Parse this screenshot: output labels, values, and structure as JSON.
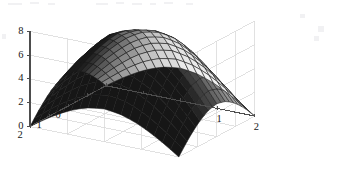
{
  "figure": {
    "kind": "surface-plot-3d",
    "background_color": "#ffffff",
    "axis_line_color": "#4d4d4d",
    "grid_color": "#d9d9d9",
    "mesh_line_color": "#1a1a1a",
    "tick_label_color": "#171717",
    "title": "",
    "artifact_note": "faint scan speckles along top edge"
  },
  "axes": {
    "z": {
      "label": "",
      "ticks": [
        "8",
        "6",
        "4",
        "2",
        "0"
      ],
      "values": [
        8,
        6,
        4,
        2,
        0
      ],
      "range": [
        0,
        8
      ]
    },
    "y": {
      "label": "",
      "ticks": [
        "2",
        "1",
        "0",
        "-1",
        "-2"
      ],
      "values": [
        2,
        1,
        0,
        -1,
        -2
      ],
      "range": [
        -2,
        2
      ]
    },
    "x": {
      "label": "",
      "ticks": [
        "-2",
        "-1",
        "0",
        "1",
        "2"
      ],
      "values": [
        -2,
        -1,
        0,
        1,
        2
      ],
      "range": [
        -2,
        2
      ]
    }
  },
  "chart_data": {
    "type": "surface",
    "title": "",
    "xlabel": "",
    "ylabel": "",
    "zlabel": "",
    "colormap": "gray",
    "shading": "faceted",
    "grid": true,
    "legend": null,
    "xlim": [
      -2,
      2
    ],
    "ylim": [
      -2,
      2
    ],
    "zlim": [
      0,
      8
    ],
    "xticks": [
      -2,
      -1,
      0,
      1,
      2
    ],
    "yticks": [
      -2,
      -1,
      0,
      1,
      2
    ],
    "zticks": [
      0,
      2,
      4,
      6,
      8
    ],
    "surface_form": "dome / inverted paraboloid peaking near center",
    "peak_value": 7.2,
    "peak_at": [
      0,
      0
    ],
    "corner_value": 0.0,
    "x": [
      -2,
      -1.6,
      -1.2,
      -0.8,
      -0.4,
      0,
      0.4,
      0.8,
      1.2,
      1.6,
      2
    ],
    "y": [
      -2,
      -1.6,
      -1.2,
      -0.8,
      -0.4,
      0,
      0.4,
      0.8,
      1.2,
      1.6,
      2
    ],
    "z": [
      [
        0.0,
        0.85,
        1.6,
        2.2,
        2.6,
        2.75,
        2.6,
        2.2,
        1.6,
        0.85,
        0.0
      ],
      [
        0.85,
        1.95,
        2.95,
        3.75,
        4.25,
        4.45,
        4.25,
        3.75,
        2.95,
        1.95,
        0.85
      ],
      [
        1.6,
        2.95,
        4.1,
        5.05,
        5.65,
        5.85,
        5.65,
        5.05,
        4.1,
        2.95,
        1.6
      ],
      [
        2.2,
        3.75,
        5.05,
        6.1,
        6.75,
        6.95,
        6.75,
        6.1,
        5.05,
        3.75,
        2.2
      ],
      [
        2.6,
        4.25,
        5.65,
        6.75,
        7.1,
        7.2,
        7.1,
        6.75,
        5.65,
        4.25,
        2.6
      ],
      [
        2.75,
        4.45,
        5.85,
        6.95,
        7.2,
        7.2,
        7.2,
        6.95,
        5.85,
        4.45,
        2.75
      ],
      [
        2.6,
        4.25,
        5.65,
        6.75,
        7.1,
        7.2,
        7.1,
        6.75,
        5.65,
        4.25,
        2.6
      ],
      [
        2.2,
        3.75,
        5.05,
        6.1,
        6.75,
        6.95,
        6.75,
        6.1,
        5.05,
        3.75,
        2.2
      ],
      [
        1.6,
        2.95,
        4.1,
        5.05,
        5.65,
        5.85,
        5.65,
        5.05,
        4.1,
        2.95,
        1.6
      ],
      [
        0.85,
        1.95,
        2.95,
        3.75,
        4.25,
        4.45,
        4.25,
        3.75,
        2.95,
        1.95,
        0.85
      ],
      [
        0.0,
        0.85,
        1.6,
        2.2,
        2.6,
        2.75,
        2.6,
        2.2,
        1.6,
        0.85,
        0.0
      ]
    ]
  }
}
